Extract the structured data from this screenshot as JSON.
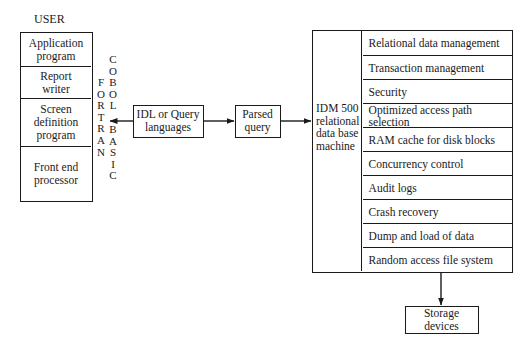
{
  "user": {
    "title": "USER",
    "components": [
      {
        "label": "Application program"
      },
      {
        "label": "Report writer"
      },
      {
        "label": "Screen definition program"
      },
      {
        "label": "Front end processor"
      }
    ],
    "languages": {
      "fortran": "FORTRAN",
      "cobol": "COBOL",
      "basic": "BASIC"
    }
  },
  "idl_box": {
    "line1": "IDL or Query",
    "line2": "languages"
  },
  "parsed_box": {
    "line1": "Parsed",
    "line2": "query"
  },
  "idm": {
    "label_lines": [
      "IDM 500",
      "relational",
      "data base",
      "machine"
    ],
    "functions": [
      "Relational data management",
      "Transaction management",
      "Security",
      "Optimized access path selection",
      "RAM cache for disk blocks",
      "Concurrency control",
      "Audit logs",
      "Crash recovery",
      "Dump and load of data",
      "Random access file system"
    ]
  },
  "storage": {
    "label": "Storage devices"
  },
  "colors": {
    "stroke": "#1a1a1a",
    "background": "#ffffff"
  }
}
